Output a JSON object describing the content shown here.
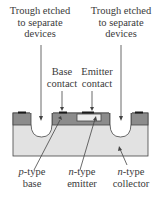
{
  "diagram": {
    "labels": {
      "trough_left": [
        "Trough etched",
        "to separate",
        "devices"
      ],
      "trough_right": [
        "Trough etched",
        "to separate",
        "devices"
      ],
      "base_contact": [
        "Base",
        "contact"
      ],
      "emitter_contact": [
        "Emitter",
        "contact"
      ],
      "p_base": {
        "prefix": "p",
        "suffix": "-type",
        "line2": "base"
      },
      "n_emitter": {
        "prefix": "n",
        "suffix": "-type",
        "line2": "emitter"
      },
      "n_collector": {
        "prefix": "n",
        "suffix": "-type",
        "line2": "collector"
      }
    },
    "colors": {
      "p_layer": "#8c8c8c",
      "n_collector": "#e2e2e2",
      "n_emitter": "#ececec",
      "contact": "#1a1a1a",
      "outline": "#333333"
    }
  }
}
